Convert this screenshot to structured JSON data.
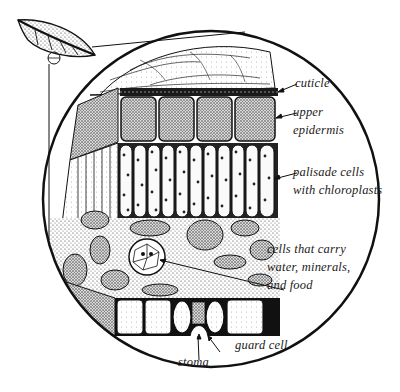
{
  "diagram": {
    "labels": {
      "cuticle": "cuticle",
      "upper_epidermis_1": "upper",
      "upper_epidermis_2": "epidermis",
      "palisade_1": "palisade cells",
      "palisade_2": "with chloroplasts",
      "vein_1": "cells that carry",
      "vein_2": "water, minerals,",
      "vein_3": "and food",
      "guard_cell": "guard cell",
      "stoma": "stoma"
    },
    "colors": {
      "ink": "#111111",
      "background": "#ffffff",
      "stipple": "#555555"
    }
  }
}
